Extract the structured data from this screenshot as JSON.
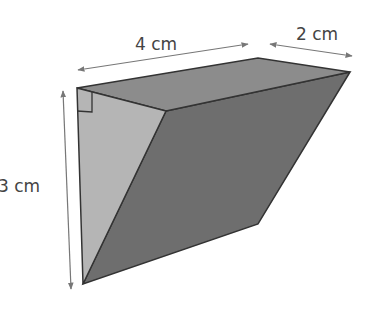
{
  "diagram": {
    "type": "triangular-prism",
    "dimensions": {
      "length": "4 cm",
      "width": "2 cm",
      "height": "3 cm"
    },
    "annotations": {
      "right_angle_marker": true
    },
    "colors": {
      "top_face": "#8c8c8c",
      "front_triangle": "#b5b5b5",
      "slanted_face": "#6e6e6e",
      "edge": "#333333",
      "dimension_line": "#777777",
      "label": "#444444",
      "background": "#ffffff"
    }
  }
}
